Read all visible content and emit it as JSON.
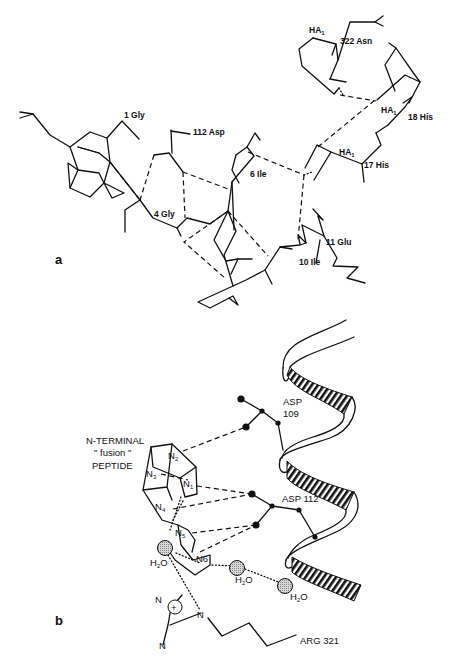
{
  "figure": {
    "panel_a": {
      "label": "a",
      "residues": [
        {
          "id": "gly1",
          "text": "1 Gly"
        },
        {
          "id": "asp112",
          "text": "112  Asp"
        },
        {
          "id": "gly4",
          "text": "4  Gly"
        },
        {
          "id": "ile6",
          "text": "6  Ile"
        },
        {
          "id": "ile10",
          "text": "10  Ile"
        },
        {
          "id": "glu11",
          "text": "11  Glu"
        },
        {
          "id": "his17",
          "text": "17  His"
        },
        {
          "id": "his18",
          "text": "18  His"
        },
        {
          "id": "asn322",
          "text": "322  Asn"
        }
      ],
      "chain_labels": [
        {
          "id": "ha1_top",
          "text": "HA",
          "sub": "1"
        },
        {
          "id": "ha1_mid",
          "text": "HA",
          "sub": "1"
        },
        {
          "id": "ha1_low",
          "text": "HA",
          "sub": "1"
        }
      ]
    },
    "panel_b": {
      "label": "b",
      "peptide_label": [
        "N-TERMINAL",
        "\" fusion \"",
        "PEPTIDE"
      ],
      "nitrogens": [
        {
          "id": "n1",
          "text": "N",
          "sub": "1"
        },
        {
          "id": "n2",
          "text": "N",
          "sub": "2"
        },
        {
          "id": "n3",
          "text": "N",
          "sub": "3"
        },
        {
          "id": "n4",
          "text": "N",
          "sub": "4"
        },
        {
          "id": "n5",
          "text": "N",
          "sub": "5"
        },
        {
          "id": "n6",
          "text": "N6"
        }
      ],
      "asp109": [
        "ASP",
        "109"
      ],
      "asp112": "ASP 112",
      "water": {
        "text": "H",
        "sub": "2",
        "tail": "O"
      },
      "arg321": "ARG 321",
      "guanidinium": {
        "charge": "+",
        "n_top": "N",
        "n_bottom": "N",
        "n_chain": "N"
      }
    }
  }
}
